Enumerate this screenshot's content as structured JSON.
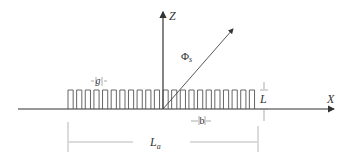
{
  "diagram": {
    "type": "grating-geometry",
    "axes": {
      "z_label": "Z",
      "x_label": "X"
    },
    "angle_label": "Φ",
    "angle_subscript": "s",
    "gap_label": "g",
    "width_label": "b",
    "height_label": "L",
    "length_label": "L",
    "length_subscript": "a",
    "pulse_count": 22,
    "colors": {
      "line": "#333333",
      "dim_line": "#999999",
      "background": "#ffffff"
    }
  }
}
